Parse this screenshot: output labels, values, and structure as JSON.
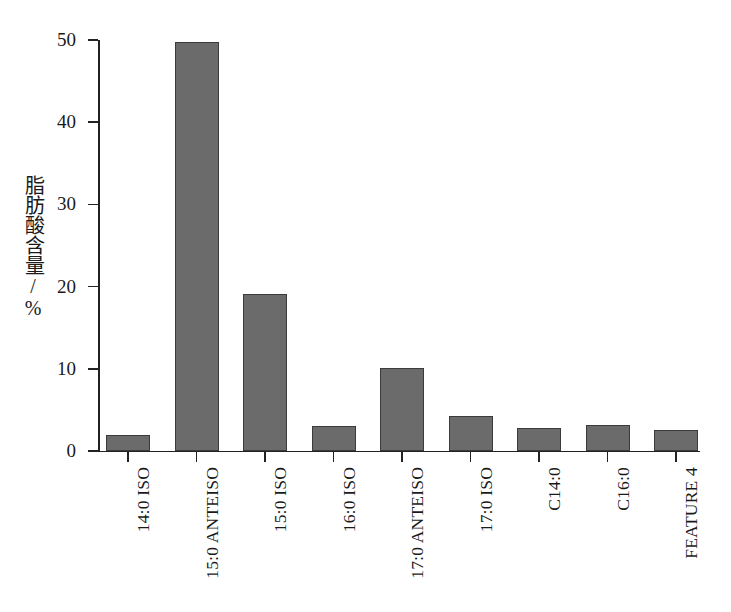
{
  "chart_data": {
    "type": "bar",
    "title": "",
    "xlabel": "",
    "ylabel": "脂肪酸含量/%",
    "ylim": [
      0,
      50
    ],
    "yticks": [
      0,
      10,
      20,
      30,
      40,
      50
    ],
    "ytick_labels": [
      "0",
      "10",
      "20",
      "30",
      "40",
      "50"
    ],
    "grid": false,
    "legend": null,
    "bar_color": "#6b6b6b",
    "bar_edge_color": "#3b3b3b",
    "axis_color": "#222222",
    "categories": [
      "14:0 ISO",
      "15:0 ANTEISO",
      "15:0 ISO",
      "16:0 ISO",
      "17:0 ANTEISO",
      "17:0 ISO",
      "C14:0",
      "C16:0",
      "FEATURE 4"
    ],
    "values": [
      2.0,
      49.8,
      19.1,
      3.0,
      10.1,
      4.3,
      2.8,
      3.2,
      2.5
    ],
    "series": [
      {
        "name": "脂肪酸含量",
        "values": [
          2.0,
          49.8,
          19.1,
          3.0,
          10.1,
          4.3,
          2.8,
          3.2,
          2.5
        ]
      }
    ]
  }
}
